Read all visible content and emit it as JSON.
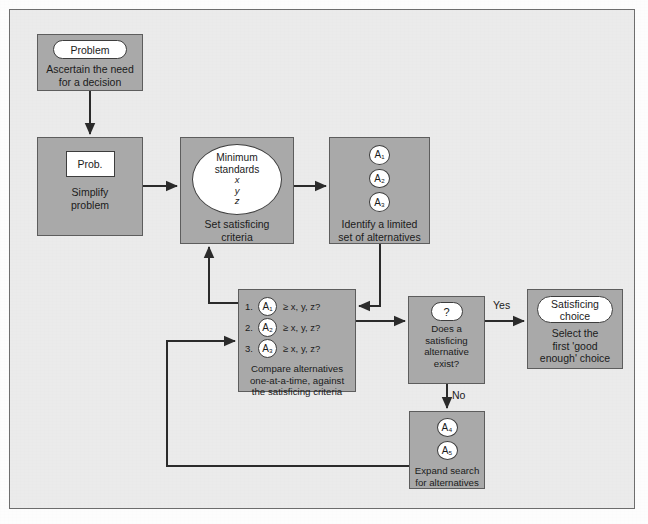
{
  "figure": {
    "colors": {
      "panel_background": "#ebebeb",
      "node_fill": "#a9a9a9",
      "node_border": "#5d5d5d",
      "inner_fill": "#ffffff",
      "inner_border": "#3d3d3d",
      "connector": "#2b2b2b",
      "text": "#1b1b1b"
    }
  },
  "nodes": {
    "problem": {
      "pill_label": "Problem",
      "caption": "Ascertain the need\nfor a decision"
    },
    "simplify": {
      "inner_label": "Prob.",
      "caption": "Simplify\nproblem"
    },
    "criteria": {
      "ellipse_title": "Minimum\nstandards",
      "variables": [
        "x",
        "y",
        "z"
      ],
      "caption": "Set satisficing\ncriteria"
    },
    "alternatives": {
      "circles": [
        "A₁",
        "A₂",
        "A₃"
      ],
      "caption": "Identify a limited\nset of alternatives"
    },
    "compare": {
      "rows": [
        {
          "number": "1.",
          "circle": "A₁",
          "condition": "≥ x, y, z?"
        },
        {
          "number": "2.",
          "circle": "A₂",
          "condition": "≥ x, y, z?"
        },
        {
          "number": "3.",
          "circle": "A₃",
          "condition": "≥ x, y, z?"
        }
      ],
      "caption": "Compare alternatives\none-at-a-time, against\nthe satisficing criteria"
    },
    "decision": {
      "pill_label": "?",
      "caption": "Does a\nsatisficing\nalternative\nexist?"
    },
    "choice": {
      "pill_label": "Satisficing\nchoice",
      "caption": "Select the\nfirst 'good\nenough' choice"
    },
    "expand": {
      "circles": [
        "A₄",
        "A₅"
      ],
      "caption": "Expand search\nfor alternatives"
    }
  },
  "edges": {
    "yes_label": "Yes",
    "no_label": "No"
  }
}
